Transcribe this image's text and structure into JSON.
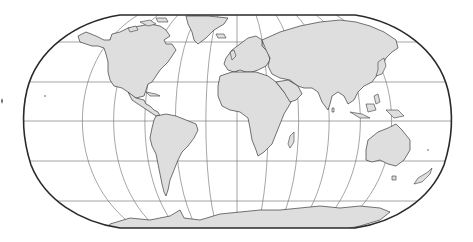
{
  "map": {
    "projection": "robinson",
    "title": "",
    "colors": {
      "land": "#dedede",
      "coast": "#3a3a3a",
      "graticule": "#6a6a6a",
      "frame": "#2a2a2a",
      "ocean": "#ffffff"
    },
    "graticule": {
      "parallels_deg": [
        -60,
        -30,
        0,
        30,
        60
      ],
      "meridians_deg": [
        -150,
        -120,
        -90,
        -60,
        -30,
        0,
        30,
        60,
        90,
        120,
        150
      ]
    },
    "continents": [
      "North America",
      "South America",
      "Europe",
      "Africa",
      "Asia",
      "Australia",
      "Antarctica",
      "Greenland"
    ]
  }
}
